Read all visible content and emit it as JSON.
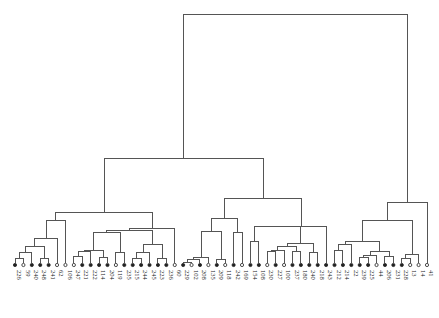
{
  "chart_data": {
    "type": "dendrogram",
    "title": "",
    "xlabel": "",
    "ylabel": "",
    "orientation": "top-down, leaves at bottom",
    "grid": false,
    "legend": null,
    "leaf_labels": [
      "226",
      "59",
      "240",
      "248",
      "241",
      "62",
      "106",
      "247",
      "221",
      "222",
      "114",
      "204",
      "119",
      "235",
      "215",
      "244",
      "245",
      "223",
      "236",
      "60",
      "229",
      "102",
      "208",
      "135",
      "209",
      "118",
      "242",
      "169",
      "154",
      "108",
      "230",
      "227",
      "100",
      "237",
      "180",
      "240",
      "218",
      "243",
      "212",
      "214",
      "22",
      "239",
      "225",
      "44",
      "206",
      "231",
      "228",
      "13",
      "14",
      "41"
    ],
    "leaf_marker_fill": [
      "filled",
      "open",
      "filled",
      "filled",
      "filled",
      "open",
      "open",
      "open",
      "filled",
      "filled",
      "filled",
      "filled",
      "open",
      "filled",
      "filled",
      "filled",
      "filled",
      "filled",
      "filled",
      "open",
      "filled",
      "open",
      "filled",
      "open",
      "filled",
      "open",
      "filled",
      "open",
      "filled",
      "filled",
      "open",
      "filled",
      "open",
      "filled",
      "filled",
      "filled",
      "filled",
      "filled",
      "filled",
      "filled",
      "filled",
      "filled",
      "filled",
      "open",
      "filled",
      "filled",
      "filled",
      "open",
      "open",
      "open"
    ],
    "merge_heights_px": {
      "root": 14,
      "left_main": 85,
      "left_upper": 120,
      "right_main": 201,
      "left_A": 201,
      "left_B_mid": 198,
      "left_B_right": 212
    }
  }
}
